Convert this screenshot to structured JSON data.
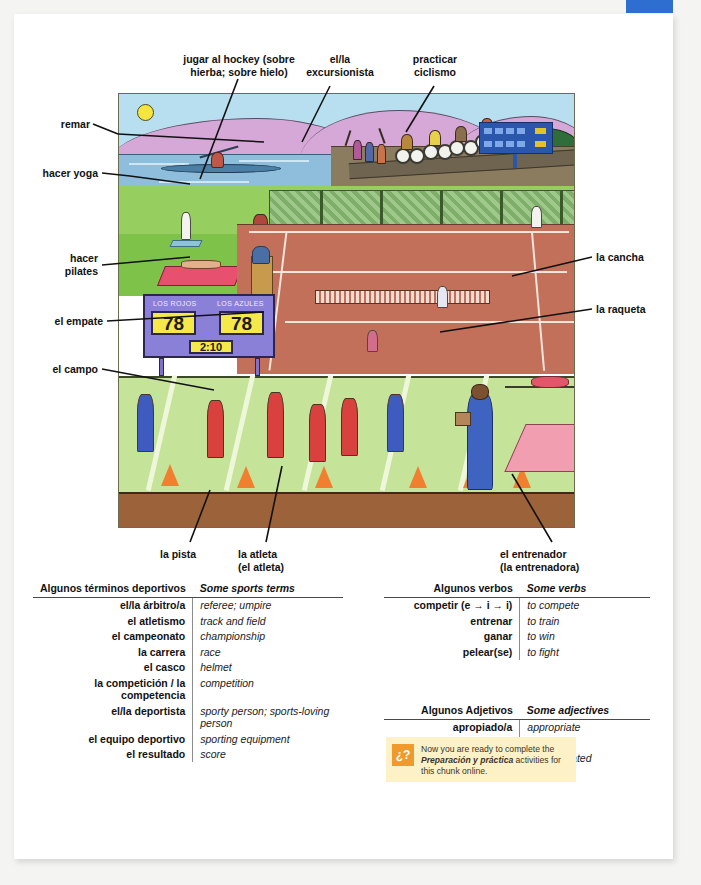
{
  "page": {
    "top_tab_color": "#2f6ed1",
    "background": "#f4f4f2"
  },
  "illustration": {
    "name": "sports-scene-illustration",
    "scoreboard": {
      "team_left": "LOS ROJOS",
      "team_right": "LOS AZULES",
      "score_left": "78",
      "score_right": "78",
      "time": "2:10",
      "panel_color": "#8b80d8",
      "digit_color": "#f4e84a"
    }
  },
  "callouts": {
    "left": [
      {
        "id": "remar",
        "text": "remar"
      },
      {
        "id": "hacer-yoga",
        "text": "hacer yoga"
      },
      {
        "id": "hacer-pilates",
        "text": "hacer\npilates"
      },
      {
        "id": "el-empate",
        "text": "el empate"
      },
      {
        "id": "el-campo",
        "text": "el campo"
      }
    ],
    "top": [
      {
        "id": "jugar-al-hockey",
        "text": "jugar al hockey (sobre\nhierba; sobre hielo)"
      },
      {
        "id": "el-la-excursionista",
        "text": "el/la\nexcursionista"
      },
      {
        "id": "practicar-ciclismo",
        "text": "practicar\nciclismo"
      }
    ],
    "right": [
      {
        "id": "la-cancha",
        "text": "la cancha"
      },
      {
        "id": "la-raqueta",
        "text": "la raqueta"
      }
    ],
    "bottom": [
      {
        "id": "la-pista",
        "text": "la pista"
      },
      {
        "id": "la-atleta",
        "text": "la atleta\n(el atleta)"
      },
      {
        "id": "el-entrenador",
        "text": "el entrenador\n(la entrenadora)"
      }
    ]
  },
  "tables": [
    {
      "id": "sports-terms",
      "header_es": "Algunos términos deportivos",
      "header_en": "Some sports terms",
      "rows": [
        {
          "es": "el/la árbitro/a",
          "en": "referee; umpire"
        },
        {
          "es": "el atletismo",
          "en": "track and field"
        },
        {
          "es": "el campeonato",
          "en": "championship"
        },
        {
          "es": "la carrera",
          "en": "race"
        },
        {
          "es": "el casco",
          "en": "helmet"
        },
        {
          "es": "la competición / la competencia",
          "en": "competition"
        },
        {
          "es": "el/la deportista",
          "en": "sporty person; sports-loving person"
        },
        {
          "es": "el equipo deportivo",
          "en": "sporting equipment"
        },
        {
          "es": "el resultado",
          "en": "score"
        }
      ]
    },
    {
      "id": "verbs",
      "header_es": "Algunos verbos",
      "header_en": "Some verbs",
      "rows": [
        {
          "es": "competir (e → i → i)",
          "en": "to compete"
        },
        {
          "es": "entrenar",
          "en": "to train"
        },
        {
          "es": "ganar",
          "en": "to win"
        },
        {
          "es": "pelear(se)",
          "en": "to fight"
        }
      ]
    },
    {
      "id": "adjectives",
      "header_es": "Algunos Adjetivos",
      "header_en": "Some adjectives",
      "rows": [
        {
          "es": "apropiado/a",
          "en": "appropriate"
        },
        {
          "es": "atlético/a",
          "en": "athletic"
        },
        {
          "es": "deportivo/a",
          "en": "sports-related"
        }
      ]
    }
  ],
  "note": {
    "icon_label": "¿?",
    "icon_color": "#f09a2b",
    "text_before": "Now you are ready to complete the ",
    "text_emphasis": "Preparación y práctica",
    "text_after": " activities for this chunk online."
  }
}
